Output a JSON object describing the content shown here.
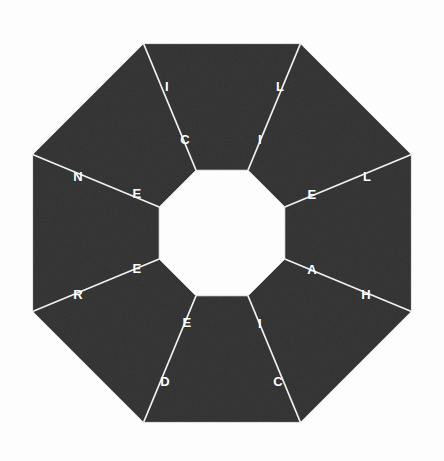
{
  "figure": {
    "shape": "octagon-annulus",
    "segment_count": 8,
    "background_color": "#fdfdfd",
    "segment_fill_color": "#151515",
    "divider_color": "#f2f2f2",
    "letter_color": "#ffffff"
  },
  "geometry": {
    "center_x": 222,
    "center_y": 233,
    "outer_radius": 205,
    "inner_radius": 68,
    "rotation_degrees": 22.5
  },
  "segments": [
    {
      "index": 0,
      "position": "top-left",
      "outer_letter": "I",
      "outer_letter_x": 167,
      "outer_letter_y": 88,
      "inner_letter": "C",
      "inner_letter_x": 185,
      "inner_letter_y": 141
    },
    {
      "index": 1,
      "position": "top-right",
      "outer_letter": "L",
      "outer_letter_x": 280,
      "outer_letter_y": 88,
      "inner_letter": "I",
      "inner_letter_x": 260,
      "inner_letter_y": 141
    },
    {
      "index": 2,
      "position": "right-upper",
      "outer_letter": "L",
      "outer_letter_x": 367,
      "outer_letter_y": 178,
      "inner_letter": "E",
      "inner_letter_x": 312,
      "inner_letter_y": 196
    },
    {
      "index": 3,
      "position": "right-lower",
      "outer_letter": "H",
      "outer_letter_x": 366,
      "outer_letter_y": 296,
      "inner_letter": "A",
      "inner_letter_x": 312,
      "inner_letter_y": 271
    },
    {
      "index": 4,
      "position": "bottom-right",
      "outer_letter": "C",
      "outer_letter_x": 278,
      "outer_letter_y": 383,
      "inner_letter": "I",
      "inner_letter_x": 260,
      "inner_letter_y": 325
    },
    {
      "index": 5,
      "position": "bottom-left",
      "outer_letter": "D",
      "outer_letter_x": 165,
      "outer_letter_y": 383,
      "inner_letter": "E",
      "inner_letter_x": 187,
      "inner_letter_y": 324
    },
    {
      "index": 6,
      "position": "left-lower",
      "outer_letter": "R",
      "outer_letter_x": 78,
      "outer_letter_y": 296,
      "inner_letter": "E",
      "inner_letter_x": 137,
      "inner_letter_y": 270
    },
    {
      "index": 7,
      "position": "left-upper",
      "outer_letter": "N",
      "outer_letter_x": 78,
      "outer_letter_y": 178,
      "inner_letter": "E",
      "inner_letter_x": 137,
      "inner_letter_y": 195
    }
  ]
}
